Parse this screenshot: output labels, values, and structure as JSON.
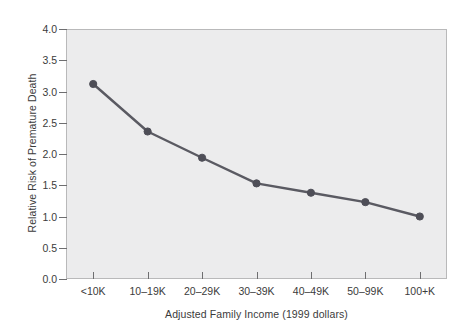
{
  "chart_data": {
    "type": "line",
    "title": "",
    "subtitle": "",
    "xlabel": "Adjusted Family Income (1999 dollars)",
    "ylabel": "Relative Risk of Premature Death",
    "categories": [
      "<10K",
      "10–19K",
      "20–29K",
      "30–39K",
      "40–49K",
      "50–99K",
      "100+K"
    ],
    "values": [
      3.12,
      2.36,
      1.94,
      1.53,
      1.38,
      1.23,
      1.0
    ],
    "series": [
      {
        "name": "Relative Risk of Premature Death",
        "values": [
          3.12,
          2.36,
          1.94,
          1.53,
          1.38,
          1.23,
          1.0
        ]
      }
    ],
    "ylim": [
      0.0,
      4.0
    ],
    "ytick_labels": [
      "0.0",
      "0.5",
      "1.0",
      "1.5",
      "2.0",
      "2.5",
      "3.0",
      "3.5",
      "4.0"
    ],
    "ytick_values": [
      0.0,
      0.5,
      1.0,
      1.5,
      2.0,
      2.5,
      3.0,
      3.5,
      4.0
    ],
    "grid": false,
    "legend": "none",
    "marker": "circle",
    "line_color": "#5a5a62",
    "marker_color": "#4e4e57",
    "plot_background": "#ececed",
    "frame_color": "#b9b9ba",
    "text_color": "#3b3b3b",
    "page_background": "#ffffff"
  }
}
